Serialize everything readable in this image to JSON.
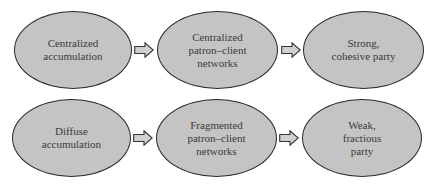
{
  "diagram": {
    "rows": [
      {
        "nodes": [
          {
            "label": "Centralized\naccumulation"
          },
          {
            "label": "Centralized\npatron–client\nnetworks"
          },
          {
            "label": "Strong,\ncohesive party"
          }
        ]
      },
      {
        "nodes": [
          {
            "label": "Diffuse\naccumulation"
          },
          {
            "label": "Fragmented\npatron–client\nnetworks"
          },
          {
            "label": "Weak,\nfractious\nparty"
          }
        ]
      }
    ],
    "arrow_icon": "right-block-arrow-icon",
    "colors": {
      "node_fill": "#c4c4c4",
      "node_border": "#2a2a2a",
      "arrow_fill": "#d0d0d0",
      "text": "#3a3a3a"
    }
  }
}
